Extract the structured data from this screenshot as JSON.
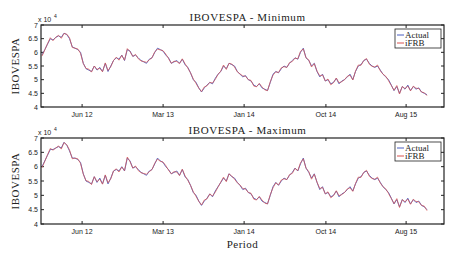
{
  "chart_data": [
    {
      "type": "line",
      "title": "IBOVESPA - Minimum",
      "xlabel": "",
      "ylabel": "IBOVESPA",
      "y_multiplier_label": "x 10^4",
      "ylim": [
        4,
        7
      ],
      "yticks": [
        "4",
        "4.5",
        "5",
        "5.5",
        "6",
        "6.5",
        "7"
      ],
      "xticks": [
        "Jun 12",
        "Mar 13",
        "Jan 14",
        "Oct 14",
        "Aug 15"
      ],
      "xtick_positions": [
        0.102,
        0.303,
        0.504,
        0.707,
        0.906
      ],
      "legend": [
        "Actual",
        "iFRB"
      ],
      "legend_position": "upper right",
      "grid": false,
      "series": [
        {
          "name": "Actual",
          "color": "#4a5fc1"
        },
        {
          "name": "iFRB",
          "color": "#d9534f"
        }
      ],
      "values": [
        5.9,
        6.1,
        6.3,
        6.5,
        6.45,
        6.55,
        6.6,
        6.55,
        6.7,
        6.65,
        6.5,
        6.2,
        6.15,
        6.1,
        6.0,
        5.6,
        5.4,
        5.35,
        5.3,
        5.5,
        5.35,
        5.45,
        5.3,
        5.6,
        5.3,
        5.5,
        5.7,
        5.8,
        5.75,
        5.9,
        5.7,
        6.1,
        6.05,
        5.85,
        5.9,
        5.8,
        5.7,
        5.65,
        5.6,
        5.75,
        5.8,
        6.0,
        6.15,
        6.1,
        6.05,
        5.9,
        5.8,
        5.6,
        5.65,
        5.7,
        5.6,
        5.75,
        5.55,
        5.45,
        5.25,
        5.0,
        4.9,
        4.7,
        4.55,
        4.7,
        4.8,
        4.9,
        4.85,
        5.05,
        5.2,
        5.3,
        5.5,
        5.4,
        5.6,
        5.55,
        5.5,
        5.3,
        5.2,
        5.1,
        5.15,
        5.0,
        4.95,
        4.8,
        4.75,
        4.85,
        4.7,
        4.65,
        4.6,
        4.9,
        5.2,
        5.3,
        5.25,
        5.4,
        5.5,
        5.45,
        5.6,
        5.7,
        5.8,
        5.75,
        6.0,
        6.15,
        5.8,
        5.7,
        5.5,
        5.6,
        5.3,
        5.1,
        5.2,
        4.95,
        5.0,
        4.85,
        4.9,
        5.05,
        4.85,
        4.95,
        5.0,
        5.1,
        5.2,
        5.0,
        5.3,
        5.5,
        5.55,
        5.7,
        5.75,
        5.6,
        5.5,
        5.45,
        5.5,
        5.35,
        5.2,
        5.1,
        5.0,
        4.8,
        4.6,
        4.75,
        4.5,
        4.75,
        4.65,
        4.8,
        4.6,
        4.75,
        4.65,
        4.7,
        4.55,
        4.5,
        4.45
      ]
    },
    {
      "type": "line",
      "title": "IBOVESPA - Maximum",
      "xlabel": "Period",
      "ylabel": "IBOVESPA",
      "y_multiplier_label": "x 10^4",
      "ylim": [
        4,
        7
      ],
      "yticks": [
        "4",
        "4.5",
        "5",
        "5.5",
        "6",
        "6.5",
        "7"
      ],
      "xticks": [
        "Jun 12",
        "Mar 13",
        "Jan 14",
        "Oct 14",
        "Aug 15"
      ],
      "xtick_positions": [
        0.102,
        0.303,
        0.504,
        0.707,
        0.906
      ],
      "legend": [
        "Actual",
        "iFRB"
      ],
      "legend_position": "upper right",
      "grid": false,
      "series": [
        {
          "name": "Actual",
          "color": "#4a5fc1"
        },
        {
          "name": "iFRB",
          "color": "#d9534f"
        }
      ],
      "values": [
        6.0,
        6.2,
        6.4,
        6.6,
        6.6,
        6.65,
        6.7,
        6.65,
        6.85,
        6.75,
        6.55,
        6.3,
        6.3,
        6.25,
        6.15,
        5.75,
        5.5,
        5.45,
        5.4,
        5.65,
        5.45,
        5.6,
        5.4,
        5.7,
        5.4,
        5.6,
        5.85,
        5.9,
        5.85,
        6.0,
        5.85,
        6.3,
        6.2,
        5.95,
        6.0,
        5.9,
        5.8,
        5.75,
        5.7,
        5.85,
        5.9,
        6.1,
        6.3,
        6.2,
        6.15,
        6.0,
        5.9,
        5.75,
        5.8,
        5.85,
        5.7,
        5.9,
        5.65,
        5.55,
        5.35,
        5.1,
        5.0,
        4.8,
        4.65,
        4.8,
        4.9,
        5.05,
        4.95,
        5.15,
        5.3,
        5.45,
        5.6,
        5.5,
        5.75,
        5.65,
        5.6,
        5.45,
        5.35,
        5.2,
        5.25,
        5.1,
        5.05,
        4.9,
        4.85,
        4.95,
        4.8,
        4.75,
        4.7,
        5.0,
        5.3,
        5.45,
        5.35,
        5.5,
        5.6,
        5.55,
        5.7,
        5.8,
        5.95,
        5.85,
        6.1,
        6.3,
        5.95,
        5.8,
        5.6,
        5.75,
        5.45,
        5.2,
        5.3,
        5.05,
        5.1,
        4.95,
        5.0,
        5.15,
        4.95,
        5.05,
        5.1,
        5.2,
        5.3,
        5.15,
        5.4,
        5.6,
        5.65,
        5.8,
        5.85,
        5.7,
        5.6,
        5.55,
        5.6,
        5.45,
        5.3,
        5.2,
        5.1,
        4.9,
        4.7,
        4.85,
        4.6,
        4.85,
        4.75,
        4.9,
        4.7,
        4.85,
        4.75,
        4.8,
        4.65,
        4.6,
        4.5
      ]
    }
  ]
}
